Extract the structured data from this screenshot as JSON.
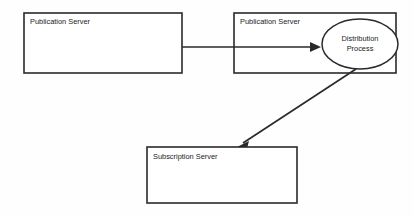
{
  "diagram": {
    "background_color": "#fefefe",
    "line_color": "#2a2a2a",
    "text_color": "#1b1b1b",
    "nodes": [
      {
        "id": "publication-server-left",
        "shape": "rectangle",
        "label": "Publication Server",
        "x": 24,
        "y": 13,
        "width": 158,
        "height": 60
      },
      {
        "id": "publication-server-right",
        "shape": "rectangle",
        "label": "Publication Server",
        "x": 234,
        "y": 13,
        "width": 162,
        "height": 60
      },
      {
        "id": "distribution-process",
        "shape": "ellipse",
        "label_line_1": "Distribution",
        "label_line_2": "Process",
        "cx": 360,
        "cy": 44,
        "rx": 38,
        "ry": 25
      },
      {
        "id": "subscription-server",
        "shape": "rectangle",
        "label": "Subscription Server",
        "x": 147,
        "y": 147,
        "width": 150,
        "height": 56
      }
    ],
    "connectors": [
      {
        "id": "publication-to-distribution",
        "from": "publication-server-left",
        "to": "distribution-process",
        "style": "straight-horizontal",
        "arrow": "end",
        "x1": 182,
        "y1": 47,
        "x2": 320,
        "y2": 47
      },
      {
        "id": "distribution-to-subscription",
        "from": "distribution-process",
        "to": "subscription-server",
        "style": "straight-diagonal",
        "arrow": "end",
        "x1": 356,
        "y1": 69,
        "x2": 237,
        "y2": 147
      }
    ]
  }
}
